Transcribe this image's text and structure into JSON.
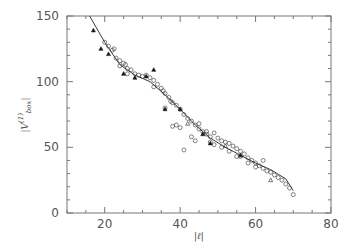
{
  "chart_data": {
    "type": "scatter",
    "title": "",
    "xlabel": "|ℓ|",
    "ylabel": "|V(1) box|",
    "xlim": [
      10,
      80
    ],
    "ylim": [
      0,
      150
    ],
    "x_ticks": [
      20,
      40,
      60,
      80
    ],
    "y_ticks": [
      0,
      50,
      100,
      150
    ],
    "grid": false,
    "legend": null,
    "series": [
      {
        "name": "open circles",
        "marker": "circle",
        "points": [
          [
            20,
            130
          ],
          [
            21,
            127
          ],
          [
            22,
            124
          ],
          [
            22.5,
            125
          ],
          [
            23,
            118
          ],
          [
            24,
            116
          ],
          [
            25,
            114
          ],
          [
            25.5,
            113
          ],
          [
            26,
            110
          ],
          [
            27,
            109
          ],
          [
            28,
            106
          ],
          [
            29,
            105
          ],
          [
            30,
            104
          ],
          [
            31,
            105
          ],
          [
            32,
            103
          ],
          [
            33,
            101
          ],
          [
            34,
            98
          ],
          [
            35,
            95
          ],
          [
            35.5,
            93
          ],
          [
            36,
            91
          ],
          [
            37,
            88
          ],
          [
            37.5,
            85
          ],
          [
            38,
            84
          ],
          [
            39,
            82
          ],
          [
            40,
            79
          ],
          [
            41,
            75
          ],
          [
            42,
            72
          ],
          [
            43,
            70
          ],
          [
            44,
            67
          ],
          [
            45,
            64
          ],
          [
            46,
            62
          ],
          [
            47,
            60
          ],
          [
            48,
            58
          ],
          [
            49,
            61
          ],
          [
            50,
            57
          ],
          [
            51,
            55
          ],
          [
            52,
            54
          ],
          [
            53,
            53
          ],
          [
            54,
            51
          ],
          [
            55,
            49
          ],
          [
            56,
            47
          ],
          [
            57,
            45
          ],
          [
            58,
            42
          ],
          [
            59,
            40
          ],
          [
            60,
            38
          ],
          [
            61,
            36
          ],
          [
            62,
            34
          ],
          [
            63,
            32
          ],
          [
            64,
            31
          ],
          [
            65,
            29
          ],
          [
            66,
            27
          ],
          [
            67,
            25
          ],
          [
            68,
            22
          ],
          [
            69,
            19
          ],
          [
            70,
            14
          ],
          [
            38,
            66
          ],
          [
            39,
            67
          ],
          [
            40,
            65
          ],
          [
            41,
            48
          ],
          [
            43,
            58
          ],
          [
            45,
            68
          ],
          [
            47,
            62
          ],
          [
            49,
            52
          ],
          [
            51,
            50
          ],
          [
            53,
            47
          ],
          [
            55,
            43
          ],
          [
            58,
            38
          ],
          [
            60,
            35
          ],
          [
            62,
            40
          ],
          [
            48,
            54
          ],
          [
            36,
            80
          ],
          [
            33,
            96
          ],
          [
            24,
            112
          ],
          [
            26,
            106
          ],
          [
            44,
            55
          ]
        ]
      },
      {
        "name": "filled triangles",
        "marker": "triangle-filled",
        "points": [
          [
            17,
            139
          ],
          [
            19,
            125
          ],
          [
            21,
            121
          ],
          [
            25,
            106
          ],
          [
            28,
            103
          ],
          [
            31,
            104
          ],
          [
            33,
            109
          ],
          [
            36,
            79
          ],
          [
            40,
            79
          ],
          [
            46,
            60
          ],
          [
            56,
            44
          ],
          [
            48,
            53
          ]
        ]
      },
      {
        "name": "open triangles",
        "marker": "triangle-open",
        "points": [
          [
            64,
            25
          ],
          [
            56,
            43
          ],
          [
            52,
            51
          ],
          [
            42,
            68
          ]
        ]
      }
    ],
    "fit_line": {
      "name": "fit curve",
      "points": [
        [
          16,
          150
        ],
        [
          20,
          130
        ],
        [
          24,
          113
        ],
        [
          28,
          105
        ],
        [
          32,
          100
        ],
        [
          36,
          90
        ],
        [
          40,
          79
        ],
        [
          44,
          67
        ],
        [
          48,
          57
        ],
        [
          52,
          50
        ],
        [
          56,
          44
        ],
        [
          60,
          38
        ],
        [
          64,
          33
        ],
        [
          68,
          26
        ],
        [
          70,
          17
        ]
      ]
    }
  }
}
